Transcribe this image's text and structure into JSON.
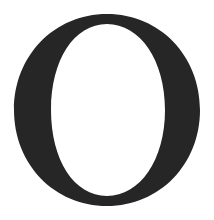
{
  "glyph": {
    "character": "O",
    "color": "#262626",
    "background": "#ffffff"
  }
}
